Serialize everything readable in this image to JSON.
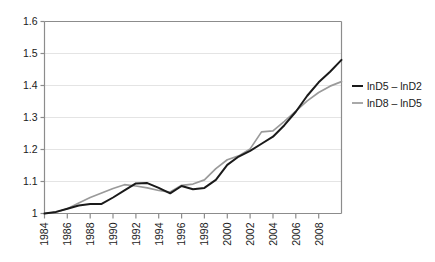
{
  "chart_data": {
    "type": "line",
    "title": "",
    "subtitle": "",
    "xlabel": "",
    "ylabel": "",
    "xlim": [
      1984,
      2010
    ],
    "ylim": [
      1.0,
      1.6
    ],
    "grid": "horizontal",
    "legend_position": "right",
    "y_ticks": [
      "1",
      "1.1",
      "1.2",
      "1.3",
      "1.4",
      "1.5",
      "1.6"
    ],
    "y_tick_values": [
      1.0,
      1.1,
      1.2,
      1.3,
      1.4,
      1.5,
      1.6
    ],
    "x_ticks": [
      "1984",
      "1986",
      "1988",
      "1990",
      "1992",
      "1994",
      "1996",
      "1998",
      "2000",
      "2002",
      "2004",
      "2006",
      "2008"
    ],
    "x_tick_values": [
      1984,
      1986,
      1988,
      1990,
      1992,
      1994,
      1996,
      1998,
      2000,
      2002,
      2004,
      2006,
      2008
    ],
    "x": [
      1984,
      1985,
      1986,
      1987,
      1988,
      1989,
      1990,
      1991,
      1992,
      1993,
      1994,
      1995,
      1996,
      1997,
      1998,
      1999,
      2000,
      2001,
      2002,
      2003,
      2004,
      2005,
      2006,
      2007,
      2008,
      2009,
      2010
    ],
    "series": [
      {
        "name": "lnD5 – lnD2",
        "color": "#1a1a1a",
        "values": [
          1.0,
          1.005,
          1.015,
          1.025,
          1.03,
          1.03,
          1.05,
          1.072,
          1.094,
          1.095,
          1.08,
          1.063,
          1.086,
          1.076,
          1.08,
          1.105,
          1.152,
          1.178,
          1.196,
          1.218,
          1.24,
          1.276,
          1.318,
          1.368,
          1.41,
          1.443,
          1.48
        ]
      },
      {
        "name": "lnD8 – lnD5",
        "color": "#9a9a9a",
        "values": [
          1.0,
          1.004,
          1.015,
          1.033,
          1.05,
          1.064,
          1.078,
          1.09,
          1.086,
          1.08,
          1.072,
          1.067,
          1.088,
          1.092,
          1.105,
          1.14,
          1.168,
          1.18,
          1.202,
          1.255,
          1.258,
          1.288,
          1.32,
          1.352,
          1.378,
          1.398,
          1.412
        ]
      }
    ],
    "legend": [
      {
        "label": "lnD5 – lnD2",
        "color": "#1a1a1a"
      },
      {
        "label": "lnD8 – lnD5",
        "color": "#9a9a9a"
      }
    ],
    "colors": {
      "series_1": "#1a1a1a",
      "series_2": "#9a9a9a",
      "axis": "#8c8c8c",
      "gridline": "#e4e4e4",
      "text": "#1a1a1a",
      "background": "#ffffff"
    }
  }
}
